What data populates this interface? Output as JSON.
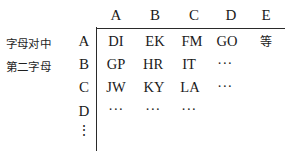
{
  "figure": {
    "side_labels": [
      "字母对中",
      "第二字母"
    ],
    "column_headers": [
      "A",
      "B",
      "C",
      "D",
      "E",
      "···"
    ],
    "row_headers": [
      "A",
      "B",
      "C",
      "D",
      "⋮"
    ],
    "rows": [
      {
        "label": "A",
        "cells": [
          "DI",
          "EK",
          "FM",
          "GO",
          "等"
        ]
      },
      {
        "label": "B",
        "cells": [
          "GP",
          "HR",
          "IT",
          "···"
        ]
      },
      {
        "label": "C",
        "cells": [
          "JW",
          "KY",
          "LA",
          "···"
        ]
      },
      {
        "label": "D",
        "cells": [
          "···",
          "···",
          "···"
        ]
      },
      {
        "label": "⋮",
        "cells": []
      }
    ],
    "colors": {
      "ink": "#1a1a1a",
      "rule": "#2a2a2a",
      "background": "#ffffff"
    }
  }
}
